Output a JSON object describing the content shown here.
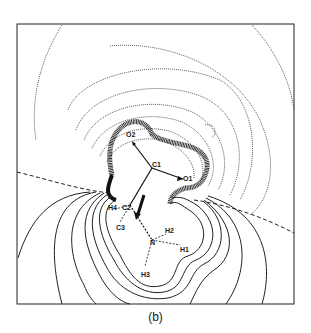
{
  "figure": {
    "caption": "(b)",
    "type": "electron density contour map",
    "frame": {
      "x": 17,
      "y": 24,
      "width": 277,
      "height": 280
    }
  },
  "atoms": [
    {
      "id": "O2",
      "label": "O2",
      "x": 131,
      "y": 133
    },
    {
      "id": "C1",
      "label": "C1",
      "x": 152,
      "y": 168
    },
    {
      "id": "O1",
      "label": "O1",
      "x": 185,
      "y": 178
    },
    {
      "id": "H4",
      "label": "H4",
      "x": 111,
      "y": 207
    },
    {
      "id": "C2",
      "label": "C2",
      "x": 127,
      "y": 207
    },
    {
      "id": "C3",
      "label": "C3",
      "x": 120,
      "y": 227
    },
    {
      "id": "N",
      "label": "N",
      "x": 153,
      "y": 242
    },
    {
      "id": "H2",
      "label": "H2",
      "x": 168,
      "y": 231
    },
    {
      "id": "H1",
      "label": "H1",
      "x": 182,
      "y": 249
    },
    {
      "id": "H3",
      "label": "H3",
      "x": 145,
      "y": 273
    }
  ],
  "bonds": [
    {
      "from": "C1",
      "to": "O2",
      "style": "solid-arrow"
    },
    {
      "from": "C1",
      "to": "O1",
      "style": "solid-arrow"
    },
    {
      "from": "C1",
      "to": "C2",
      "style": "solid"
    },
    {
      "from": "C2",
      "to": "N",
      "style": "dashed"
    },
    {
      "from": "C2",
      "to": "H4",
      "style": "dashed"
    },
    {
      "from": "C2",
      "to": "C3",
      "style": "dashed"
    },
    {
      "from": "N",
      "to": "H2",
      "style": "dashed"
    },
    {
      "from": "N",
      "to": "H1",
      "style": "dashed"
    },
    {
      "from": "N",
      "to": "H3",
      "style": "dashed"
    }
  ],
  "legend": {
    "solid_contours": "positive",
    "dotted_contours": "negative",
    "dashed_contour": "zero"
  }
}
